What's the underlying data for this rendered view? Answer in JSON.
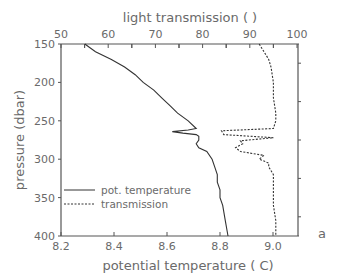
{
  "chart_data": {
    "type": "line",
    "title": "",
    "panel_label": "a",
    "top_axis": {
      "label": "light transmission ( )",
      "ticks": [
        "50",
        "60",
        "70",
        "80",
        "90",
        "100"
      ],
      "range": [
        50,
        100
      ]
    },
    "bottom_axis": {
      "label": "potential temperature ( C)",
      "ticks": [
        "8.2",
        "8.4",
        "8.6",
        "8.8",
        "9.0"
      ],
      "range": [
        8.2,
        9.1
      ]
    },
    "y_axis": {
      "label": "pressure (dbar)",
      "ticks": [
        "150",
        "200",
        "250",
        "300",
        "350",
        "400"
      ],
      "range": [
        150,
        400
      ],
      "inverted": true
    },
    "legend": {
      "position": "lower-left",
      "entries": [
        {
          "label": "pot. temperature",
          "style": "solid"
        },
        {
          "label": "transmission",
          "style": "dashed"
        }
      ]
    },
    "series": [
      {
        "name": "pot. temperature",
        "axis": "bottom",
        "style": "solid",
        "pressure": [
          150,
          160,
          170,
          180,
          190,
          200,
          210,
          220,
          230,
          240,
          250,
          260,
          262,
          264,
          266,
          268,
          270,
          275,
          280,
          285,
          290,
          300,
          310,
          320,
          330,
          340,
          350,
          360,
          380,
          400
        ],
        "values": [
          8.29,
          8.33,
          8.39,
          8.44,
          8.48,
          8.51,
          8.55,
          8.58,
          8.61,
          8.64,
          8.68,
          8.71,
          8.68,
          8.62,
          8.66,
          8.71,
          8.72,
          8.72,
          8.71,
          8.72,
          8.75,
          8.77,
          8.78,
          8.79,
          8.79,
          8.8,
          8.8,
          8.81,
          8.82,
          8.83
        ]
      },
      {
        "name": "transmission",
        "axis": "top",
        "style": "dashed",
        "pressure": [
          150,
          160,
          170,
          180,
          200,
          220,
          240,
          250,
          260,
          263,
          268,
          272,
          276,
          280,
          285,
          290,
          295,
          300,
          305,
          310,
          320,
          340,
          360,
          380,
          400
        ],
        "values": [
          92,
          93,
          94,
          94.5,
          95,
          95,
          95.5,
          95.5,
          95,
          84,
          84.5,
          95,
          88,
          88.5,
          87,
          88,
          93,
          92,
          94,
          94,
          95,
          95,
          95,
          95.5,
          95.5
        ]
      }
    ]
  }
}
